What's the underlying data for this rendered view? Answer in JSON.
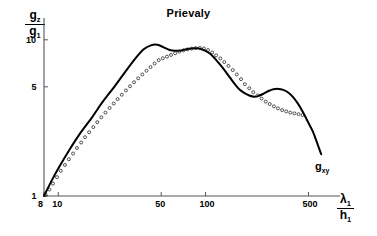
{
  "chart_data": {
    "type": "line",
    "title": "Prievaly",
    "xlabel_num": "λ",
    "xlabel_num_sub": "1",
    "xlabel_den": "h",
    "xlabel_den_sub": "1",
    "ylabel_num": "g",
    "ylabel_num_sub": "z",
    "ylabel_den": "g",
    "ylabel_den_sub": "1",
    "xscale": "log",
    "yscale": "log",
    "xlim": [
      8,
      700
    ],
    "ylim": [
      1,
      13
    ],
    "grid": false,
    "legend": "none",
    "xticks": [
      8,
      10,
      50,
      100,
      500
    ],
    "xticklabels": [
      "8",
      "10",
      "50",
      "100",
      "500"
    ],
    "yticks": [
      1,
      5,
      10
    ],
    "yticklabels": [
      "1",
      "5",
      "10"
    ],
    "series": [
      {
        "name": "g_xy",
        "style": "solid-curve",
        "annotation": "g_xy",
        "x": [
          8,
          9,
          10,
          12,
          14,
          17,
          20,
          24,
          28,
          33,
          38,
          43,
          47,
          52,
          57,
          62,
          68,
          74,
          80,
          87,
          94,
          100,
          108,
          117,
          126,
          136,
          147,
          158,
          170,
          184,
          198,
          214,
          230,
          248,
          268,
          289,
          312,
          337,
          364,
          393,
          424,
          458,
          494,
          534,
          576,
          610
        ],
        "y": [
          1.0,
          1.25,
          1.5,
          2.0,
          2.5,
          3.2,
          4.0,
          5.0,
          6.1,
          7.5,
          8.7,
          9.25,
          9.3,
          8.95,
          8.6,
          8.5,
          8.55,
          8.7,
          8.8,
          8.82,
          8.7,
          8.5,
          8.1,
          7.5,
          6.9,
          6.3,
          5.7,
          5.2,
          4.8,
          4.55,
          4.4,
          4.32,
          4.38,
          4.52,
          4.7,
          4.82,
          4.85,
          4.78,
          4.6,
          4.3,
          3.9,
          3.45,
          3.0,
          2.6,
          2.15,
          1.85
        ]
      },
      {
        "name": "measured-points",
        "style": "open-circles",
        "x": [
          8.2,
          8.7,
          9.2,
          9.8,
          10.4,
          11.1,
          11.8,
          12.6,
          13.4,
          14.3,
          15.2,
          16.2,
          17.3,
          18.4,
          19.6,
          20.9,
          22.3,
          23.8,
          25.3,
          27.0,
          28.8,
          30.7,
          32.7,
          34.9,
          37.2,
          39.7,
          42.3,
          45.1,
          48.1,
          51.3,
          54.7,
          58.3,
          62.2,
          66.3,
          70.7,
          75.4,
          80.4,
          85.7,
          91.4,
          97.5,
          104,
          111,
          118,
          126,
          134,
          143,
          153,
          163,
          174,
          185,
          198,
          211,
          225,
          240,
          256,
          273,
          291,
          310,
          331,
          353,
          376,
          401,
          428,
          456
        ],
        "y": [
          1.02,
          1.1,
          1.2,
          1.32,
          1.45,
          1.58,
          1.72,
          1.87,
          2.03,
          2.2,
          2.38,
          2.56,
          2.76,
          2.97,
          3.19,
          3.42,
          3.66,
          3.91,
          4.17,
          4.45,
          4.74,
          5.04,
          5.35,
          5.67,
          6.0,
          6.34,
          6.69,
          7.05,
          7.41,
          7.62,
          7.8,
          8.0,
          8.2,
          8.4,
          8.55,
          8.68,
          8.78,
          8.85,
          8.88,
          8.8,
          8.6,
          8.3,
          7.95,
          7.6,
          7.2,
          6.8,
          6.4,
          6.0,
          5.6,
          5.2,
          4.9,
          4.62,
          4.4,
          4.2,
          4.02,
          3.88,
          3.75,
          3.64,
          3.55,
          3.48,
          3.42,
          3.38,
          3.34,
          3.3
        ]
      }
    ]
  },
  "title": "Prievaly",
  "curve_annotation": {
    "base": "g",
    "sub": "xy"
  },
  "axes": {
    "x_tick_labels": [
      "8",
      "10",
      "50",
      "100",
      "500"
    ],
    "y_tick_labels": [
      "10",
      "5",
      "1"
    ]
  }
}
